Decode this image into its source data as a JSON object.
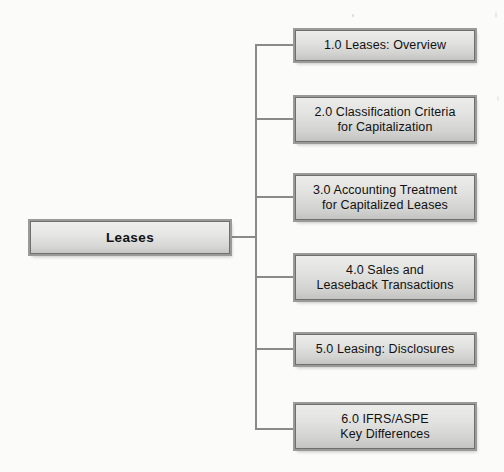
{
  "diagram": {
    "type": "tree-map",
    "title": "Leases",
    "root": {
      "label": "Leases",
      "x": 30,
      "y": 221,
      "width": 200,
      "height": 33
    },
    "trunk": {
      "x": 256,
      "top": 45,
      "bottom": 429,
      "stub_from_root_x": 230,
      "stub_y": 237
    },
    "child_box": {
      "left": 295,
      "right": 475,
      "width": 180,
      "connector_start_x": 256
    },
    "children": [
      {
        "id": "1",
        "number": "1.0",
        "label": "1.0 Leases:  Overview",
        "lines": [
          "1.0 Leases:  Overview"
        ],
        "y": 30,
        "height": 31,
        "center_y": 45
      },
      {
        "id": "2",
        "number": "2.0",
        "label": "2.0 Classification Criteria\nfor Capitalization",
        "lines": [
          "2.0 Classification Criteria",
          "for Capitalization"
        ],
        "y": 97,
        "height": 45,
        "center_y": 119
      },
      {
        "id": "3",
        "number": "3.0",
        "label": "3.0 Accounting Treatment\nfor Capitalized Leases",
        "lines": [
          "3.0 Accounting Treatment",
          "for Capitalized Leases"
        ],
        "y": 175,
        "height": 45,
        "center_y": 197
      },
      {
        "id": "4",
        "number": "4.0",
        "label": "4.0 Sales and\nLeaseback Transactions",
        "lines": [
          "4.0 Sales and",
          "Leaseback Transactions"
        ],
        "y": 255,
        "height": 45,
        "center_y": 277
      },
      {
        "id": "5",
        "number": "5.0",
        "label": "5.0 Leasing:  Disclosures",
        "lines": [
          "5.0 Leasing:  Disclosures"
        ],
        "y": 334,
        "height": 31,
        "center_y": 349
      },
      {
        "id": "6",
        "number": "6.0",
        "label": "6.0 IFRS/ASPE\nKey Differences",
        "lines": [
          "6.0 IFRS/ASPE",
          "Key Differences"
        ],
        "y": 404,
        "height": 45,
        "center_y": 426
      }
    ],
    "colors": {
      "page_background": "#fbfbf9",
      "node_fill_top": "#ececeb",
      "node_fill_bottom": "#c3c3c1",
      "node_border": "#6f6f6f",
      "node_outer_border": "#9a9a98",
      "connector": "#8a8a8a",
      "text": "#111111"
    }
  }
}
